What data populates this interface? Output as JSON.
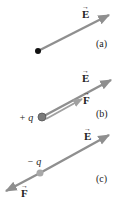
{
  "colors": {
    "arrow": "#8f8f8f",
    "arrow_light": "#b8b8b8",
    "text": "#222222",
    "dot": "#111111",
    "charge_positive": "#7a7a7a",
    "charge_negative": "#a8a8a8"
  },
  "panels": [
    {
      "id": "a",
      "label": "(a)",
      "field_label": "E",
      "point": "black-dot"
    },
    {
      "id": "b",
      "label": "(b)",
      "field_label": "E",
      "force_label": "F",
      "charge_label": "+ q"
    },
    {
      "id": "c",
      "label": "(c)",
      "field_label": "E",
      "force_label": "F",
      "charge_label": "− q"
    }
  ]
}
